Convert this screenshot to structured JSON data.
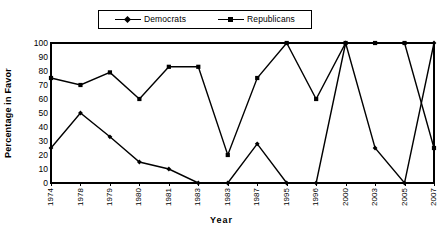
{
  "chart_data": {
    "type": "line",
    "title": "",
    "xlabel": "Year",
    "ylabel": "Percentage in Favor",
    "ylim": [
      0,
      100
    ],
    "ytick_step": 10,
    "yticks": [
      100,
      90,
      80,
      70,
      60,
      50,
      40,
      30,
      20,
      10,
      0
    ],
    "grid": true,
    "legend_position": "top-center",
    "categories": [
      "1974",
      "1978",
      "1979",
      "1980",
      "1981",
      "1983",
      "1983",
      "1987",
      "1995",
      "1996",
      "2000",
      "2003",
      "2005",
      "2007"
    ],
    "series": [
      {
        "name": "Democrats",
        "marker": "diamond",
        "color": "#000000",
        "values": [
          25,
          50,
          33,
          15,
          10,
          0,
          0,
          28,
          0,
          0,
          100,
          25,
          0,
          100
        ]
      },
      {
        "name": "Republicans",
        "marker": "square",
        "color": "#000000",
        "values": [
          75,
          70,
          79,
          60,
          83,
          83,
          20,
          75,
          100,
          60,
          100,
          100,
          100,
          25
        ]
      }
    ]
  },
  "legend": {
    "entries": [
      {
        "label": "Democrats",
        "marker": "diamond"
      },
      {
        "label": "Republicans",
        "marker": "square"
      }
    ]
  },
  "axes": {
    "x_title": "Year",
    "y_title": "Percentage in Favor"
  }
}
